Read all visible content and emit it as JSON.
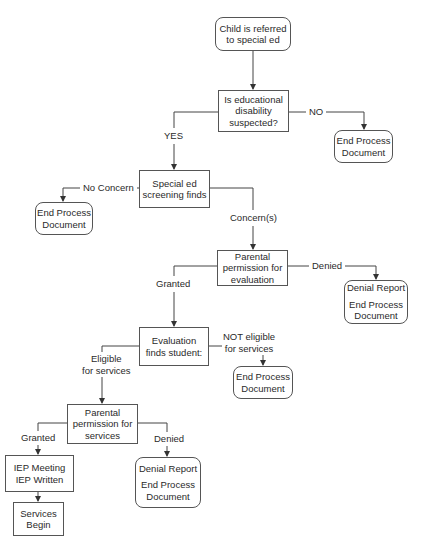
{
  "diagram": {
    "type": "flowchart",
    "nodes": {
      "start": {
        "lines": [
          "Child is referred",
          "to special ed"
        ],
        "shape": "rounded"
      },
      "disability_question": {
        "lines": [
          "Is educational",
          "disability",
          "suspected?"
        ],
        "shape": "rect"
      },
      "end_no_disability": {
        "lines": [
          "End Process",
          "Document"
        ],
        "shape": "rounded"
      },
      "screening": {
        "lines": [
          "Special ed",
          "screening finds"
        ],
        "shape": "rect"
      },
      "end_no_concern": {
        "lines": [
          "End Process",
          "Document"
        ],
        "shape": "rounded"
      },
      "permission_evaluation": {
        "lines": [
          "Parental",
          "permission for",
          "evaluation"
        ],
        "shape": "rect"
      },
      "denial_evaluation": {
        "lines": [
          "Denial Report",
          "End Process",
          "Document"
        ],
        "shape": "rounded"
      },
      "evaluation": {
        "lines": [
          "Evaluation",
          "finds student:"
        ],
        "shape": "rect"
      },
      "end_not_eligible": {
        "lines": [
          "End Process",
          "Document"
        ],
        "shape": "rounded"
      },
      "permission_services": {
        "lines": [
          "Parental",
          "permission for",
          "services"
        ],
        "shape": "rect"
      },
      "iep": {
        "lines": [
          "IEP Meeting",
          "IEP Written"
        ],
        "shape": "rect"
      },
      "services_begin": {
        "lines": [
          "Services",
          "Begin"
        ],
        "shape": "rect"
      },
      "denial_services": {
        "lines": [
          "Denial Report",
          "End Process",
          "Document"
        ],
        "shape": "rounded"
      }
    },
    "edge_labels": {
      "no": "NO",
      "yes": "YES",
      "no_concern": "No Concern",
      "concerns": "Concern(s)",
      "granted_eval": "Granted",
      "denied_eval": "Denied",
      "eligible": [
        "Eligible",
        "for services"
      ],
      "not_eligible": [
        "NOT eligible",
        "for services"
      ],
      "granted_services": "Granted",
      "denied_services": "Denied"
    },
    "colors": {
      "line": "#444444",
      "border": "#555555",
      "text": "#2a2a2a",
      "background": "#ffffff"
    }
  }
}
